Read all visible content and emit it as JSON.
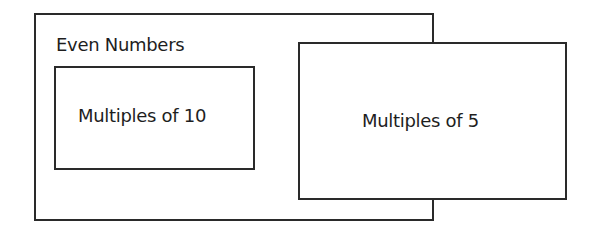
{
  "diagram": {
    "type": "set-containment",
    "sets": [
      {
        "id": "even",
        "label": "Even Numbers",
        "contains": [
          "mult10"
        ]
      },
      {
        "id": "mult10",
        "label": "Multiples of 10",
        "inside": "even"
      },
      {
        "id": "mult5",
        "label": "Multiples of 5",
        "overlaps": "even"
      }
    ],
    "colors": {
      "stroke": "#2a2a2a",
      "text": "#1e1e1e",
      "background": "#ffffff"
    }
  }
}
